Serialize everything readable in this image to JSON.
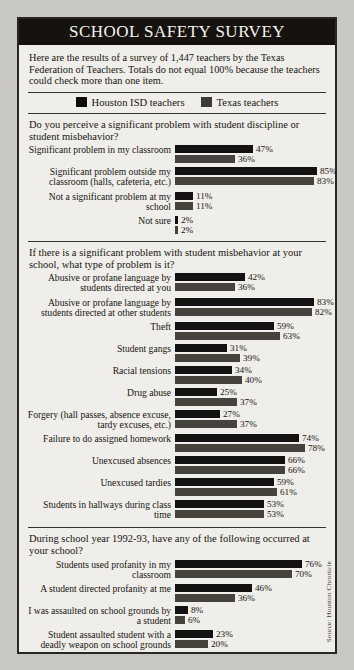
{
  "title": "SCHOOL SAFETY SURVEY",
  "intro": "Here are the results of a survey of 1,447 teachers by the Texas Federation of Teachers. Totals do not equal 100% because the teachers could check more than one item.",
  "legend": [
    {
      "label": "Houston ISD teachers",
      "color": "#100e0b",
      "key": "houston"
    },
    {
      "label": "Texas teachers",
      "color": "#3e3b36",
      "key": "texas"
    }
  ],
  "source": "Source: Houston Chronicle",
  "scale_px_per_percent": 1.67,
  "chart_data": {
    "type": "bar",
    "title": "SCHOOL SAFETY SURVEY",
    "xlabel": "",
    "ylabel": "",
    "xlim": [
      0,
      100
    ],
    "grid": false,
    "legend_position": "top",
    "series_names": [
      "Houston ISD teachers",
      "Texas teachers"
    ],
    "sections": [
      {
        "question": "Do you perceive a significant problem with student discipline or student misbehavior?",
        "categories": [
          "Significant problem in my classroom",
          "Significant problem outside my classroom (halls, cafeteria, etc.)",
          "Not a significant problem at my school",
          "Not sure"
        ],
        "series": [
          {
            "name": "Houston ISD teachers",
            "values": [
              47,
              85,
              11,
              2
            ]
          },
          {
            "name": "Texas teachers",
            "values": [
              36,
              83,
              11,
              2
            ]
          }
        ]
      },
      {
        "question": "If there is a significant problem with student misbehavior at your school, what type of problem is it?",
        "categories": [
          "Abusive or profane language by students directed at you",
          "Abusive or profane language by students directed at other students",
          "Theft",
          "Student gangs",
          "Racial tensions",
          "Drug abuse",
          "Forgery (hall passes, absence excuse, tardy excuses, etc.)",
          "Failure to do assigned homework",
          "Unexcused absences",
          "Unexcused tardies",
          "Students in hallways during class time"
        ],
        "series": [
          {
            "name": "Houston ISD teachers",
            "values": [
              42,
              83,
              59,
              31,
              34,
              25,
              27,
              74,
              66,
              59,
              53
            ]
          },
          {
            "name": "Texas teachers",
            "values": [
              36,
              82,
              63,
              39,
              40,
              37,
              37,
              78,
              66,
              61,
              53
            ]
          }
        ]
      },
      {
        "question": "During school year 1992-93, have any of the following occurred at your school?",
        "categories": [
          "Students used profanity in my classroom",
          "A student directed profanity at me",
          "I was assaulted on school grounds by a student",
          "Student assaulted student with a deadly weapon on school grounds",
          "Student assaulted student on school grounds, without deadly weapon",
          "My personal property was vandalized",
          "My personal property was stolen"
        ],
        "series": [
          {
            "name": "Houston ISD teachers",
            "values": [
              76,
              46,
              8,
              23,
              59,
              26,
              39
            ]
          },
          {
            "name": "Texas teachers",
            "values": [
              70,
              36,
              6,
              20,
              69,
              23,
              34
            ]
          }
        ]
      }
    ]
  }
}
